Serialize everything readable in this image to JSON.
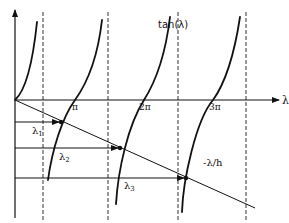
{
  "figure": {
    "curve_label": "tan(λ)",
    "line_label": "-λ/h",
    "x_axis_label": "λ",
    "ticks": [
      "π",
      "2π",
      "3π"
    ],
    "roots": [
      {
        "name": "λ",
        "sub": "1"
      },
      {
        "name": "λ",
        "sub": "2"
      },
      {
        "name": "λ",
        "sub": "3"
      }
    ],
    "colors": {
      "ink": "#111111",
      "background": "#ffffff"
    }
  }
}
